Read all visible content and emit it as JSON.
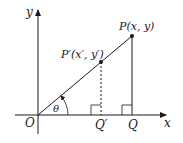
{
  "diagram": {
    "labels": {
      "y_axis": "y",
      "x_axis": "x",
      "origin": "O",
      "point_p": "P(x, y)",
      "point_p_prime": "P′(x′, y′)",
      "point_q": "Q",
      "point_q_prime": "Q′",
      "angle": "θ"
    },
    "colors": {
      "line": "#1a1a1a",
      "background": "#ffffff"
    }
  }
}
